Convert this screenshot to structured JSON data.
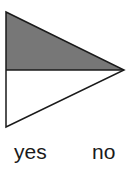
{
  "diagram": {
    "shape": "triangle split horizontally",
    "top_half": {
      "fill": "#777777"
    },
    "bottom_half": {
      "fill": "#ffffff"
    },
    "stroke": "#1a1a1a"
  },
  "labels": {
    "left": "yes",
    "right": "no"
  }
}
